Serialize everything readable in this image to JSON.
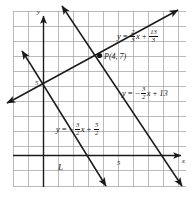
{
  "figure": {
    "type": "coordinate-graph",
    "axes": {
      "x_label": "x",
      "y_label": "y",
      "x_tick_label": "5",
      "y_tick_label": "5",
      "x_tick_value": 5,
      "y_tick_value": 5,
      "grid": true,
      "grid_spacing_units": 1,
      "xlim": [
        -2,
        10
      ],
      "ylim": [
        -2,
        11
      ]
    },
    "point": {
      "name": "P",
      "label": "P(4, 7)",
      "x": 4,
      "y": 7
    },
    "line_label": "L",
    "equations": {
      "line1": {
        "text": "y = 2/3 x + 13/3",
        "y": "y",
        "eq": "=",
        "slope_num": "2",
        "slope_den": "3",
        "var": "x",
        "plus": "+",
        "int_num": "13",
        "int_den": "3",
        "slope": 0.6667,
        "intercept": 4.3333
      },
      "line2": {
        "text": "y = -3/2 x + 13",
        "y": "y",
        "eq": "=",
        "minus": "−",
        "slope_num": "3",
        "slope_den": "2",
        "var": "x",
        "plus": "+",
        "intercept_text": "13",
        "slope": -1.5,
        "intercept": 13
      },
      "line3": {
        "text": "y = -3/2 x + 5/2",
        "y": "y",
        "eq": "=",
        "minus": "−",
        "slope_num": "3",
        "slope_den": "2",
        "var": "x",
        "plus": "+",
        "int_num": "5",
        "int_den": "2",
        "slope": -1.5,
        "intercept": 2.5
      }
    },
    "colors": {
      "grid": "#9a9a9a",
      "axis": "#1a1a1a",
      "line": "#1a1a1a",
      "background": "#ffffff"
    }
  }
}
